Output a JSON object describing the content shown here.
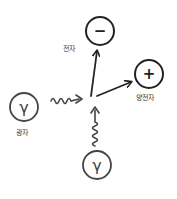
{
  "diagram": {
    "type": "feynman-pair-production",
    "colors": {
      "stroke": "#222222",
      "photon_stroke": "#444444",
      "background": "#ffffff"
    },
    "particles": {
      "electron": {
        "symbol": "−",
        "label": "전자"
      },
      "positron": {
        "symbol": "+",
        "label": "양전자"
      },
      "photon_left": {
        "symbol": "γ",
        "label": "광자"
      },
      "photon_bottom": {
        "symbol": "γ",
        "label": ""
      }
    },
    "edges": [
      {
        "from": "photon_left",
        "to": "vertex",
        "style": "wavy"
      },
      {
        "from": "photon_bottom",
        "to": "vertex",
        "style": "wavy"
      },
      {
        "from": "vertex",
        "to": "electron",
        "style": "arrow"
      },
      {
        "from": "vertex",
        "to": "positron",
        "style": "arrow"
      }
    ]
  }
}
